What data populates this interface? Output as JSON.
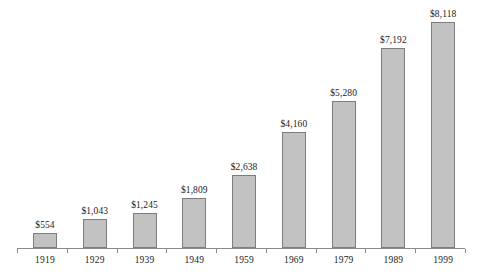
{
  "chart_data": {
    "type": "bar",
    "title": "",
    "subtitle": "",
    "xlabel": "",
    "ylabel": "",
    "categories": [
      "1919",
      "1929",
      "1939",
      "1949",
      "1959",
      "1969",
      "1979",
      "1989",
      "1999"
    ],
    "values": [
      554,
      1043,
      1245,
      1809,
      2638,
      4160,
      5280,
      7192,
      8118
    ],
    "value_labels": [
      "$554",
      "$1,043",
      "$1,245",
      "$1,809",
      "$2,638",
      "$4,160",
      "$5,280",
      "$7,192",
      "$8,118"
    ],
    "ylim": [
      0,
      8118
    ],
    "grid": false,
    "legend": null,
    "axis_visible": {
      "x": true,
      "y": false
    },
    "annotations": []
  },
  "style": {
    "bar_fill": "#c2c2c2",
    "bar_border": "#7d7d7d",
    "axis_color": "#8a8a8a",
    "text_color": "#1a1a1a",
    "background": "#ffffff"
  }
}
